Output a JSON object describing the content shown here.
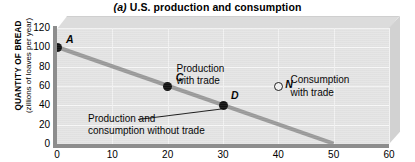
{
  "chart_data": {
    "type": "scatter",
    "title": "(a) U.S. production and consumption",
    "title_prefix": "(a)",
    "title_rest": " U.S. production and consumption",
    "xlabel": "",
    "ylabel_main": "QUANTITY OF BREAD",
    "ylabel_sub": "(zillions of loaves per year)",
    "xlim": [
      0,
      60
    ],
    "ylim": [
      0,
      120
    ],
    "xticks": [
      0,
      10,
      20,
      30,
      40,
      50,
      60
    ],
    "yticks": [
      0,
      20,
      40,
      60,
      80,
      100,
      120
    ],
    "grid": true,
    "legend": "none",
    "series": [
      {
        "name": "production possibilities frontier",
        "type": "line",
        "color": "#9a9a9a",
        "x": [
          0,
          50
        ],
        "y": [
          100,
          0
        ]
      },
      {
        "name": "points",
        "type": "scatter",
        "points": [
          {
            "label": "A",
            "x": 0,
            "y": 100,
            "marker": "filled",
            "label_dx": 9,
            "label_dy": -13
          },
          {
            "label": "C",
            "x": 20,
            "y": 60,
            "marker": "filled",
            "label_dx": 8,
            "label_dy": -14
          },
          {
            "label": "D",
            "x": 30,
            "y": 40,
            "marker": "filled",
            "label_dx": 8,
            "label_dy": -15
          },
          {
            "label": "N",
            "x": 40,
            "y": 60,
            "marker": "open",
            "label_dx": 7,
            "label_dy": -7
          }
        ]
      }
    ],
    "annotations": [
      {
        "name": "production-with-trade",
        "text_line1": "Production",
        "text_line2": "with trade",
        "x": 21.6,
        "y": 78
      },
      {
        "name": "consumption-with-trade",
        "text_line1": "Consumption",
        "text_line2": "with trade",
        "x": 42.2,
        "y": 66
      },
      {
        "name": "production-and-consumption-without-trade",
        "text_line1": "Production and",
        "text_line2": "consumption without trade",
        "x": 5.6,
        "y": 26
      }
    ]
  },
  "colors": {
    "ppf_line": "#9a9a9a",
    "plot_background": "#e4e4e4",
    "axis": "#8d8d8d",
    "text": "#000000",
    "marker_filled": "#111111"
  }
}
